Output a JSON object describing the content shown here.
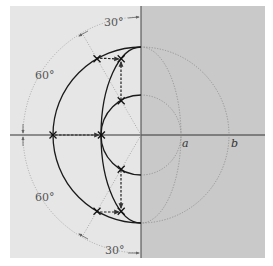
{
  "diagram": {
    "labels": {
      "angle_top": "30°",
      "angle_upper_left": "60°",
      "angle_lower_left": "60°",
      "angle_bottom": "30°",
      "semi_axis_a": "a",
      "semi_axis_b": "b"
    },
    "angles_deg": {
      "parameter": 30,
      "complement": 60
    },
    "ratio_a_to_b": 0.45,
    "colors": {
      "left_panel": "#e6e6e6",
      "right_panel": "#c9c9c9",
      "solid_curve": "#1a1a1a",
      "dotted_curve": "#8a8a8a"
    }
  }
}
